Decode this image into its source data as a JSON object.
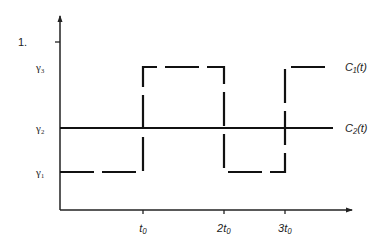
{
  "chart_data": {
    "type": "line",
    "figure_number": "1.",
    "title": "",
    "xlabel": "",
    "ylabel": "",
    "grid": false,
    "x_ticks": [
      {
        "value": 1,
        "label": "t₀"
      },
      {
        "value": 2,
        "label": "2t₀"
      },
      {
        "value": 3,
        "label": "3t₀"
      }
    ],
    "y_ticks": [
      {
        "value": 1,
        "label": "γ₁"
      },
      {
        "value": 2,
        "label": "γ₂"
      },
      {
        "value": 3,
        "label": "γ₃"
      }
    ],
    "xlim": [
      0,
      3.6
    ],
    "ylim": [
      0,
      3.9
    ],
    "y_unlabeled_tick": 3.4,
    "series": [
      {
        "name": "C₁(t)",
        "style": "dashed-step",
        "points": [
          [
            0,
            1
          ],
          [
            1,
            1
          ],
          [
            1,
            3
          ],
          [
            2,
            3
          ],
          [
            2,
            1
          ],
          [
            3,
            1
          ],
          [
            3,
            3
          ],
          [
            3.45,
            3
          ]
        ]
      },
      {
        "name": "C₂(t)",
        "style": "solid",
        "points": [
          [
            0,
            2
          ],
          [
            3.45,
            2
          ]
        ]
      }
    ],
    "legend": "right-inline"
  }
}
